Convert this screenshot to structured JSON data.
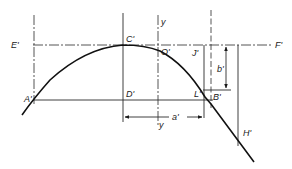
{
  "diagram": {
    "type": "geometric construction",
    "labels": {
      "E": "E'",
      "F": "F'",
      "C": "C'",
      "O": "O'",
      "J": "J'",
      "A": "A'",
      "D": "D'",
      "L": "L'",
      "B": "B'",
      "H": "H'",
      "y_top": "y",
      "y_bottom": "y",
      "a": "a'",
      "b": "b'"
    },
    "colors": {
      "ink": "#1a1a1a",
      "background": "#ffffff"
    }
  }
}
